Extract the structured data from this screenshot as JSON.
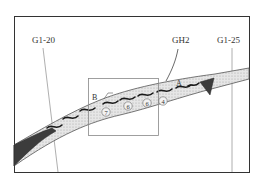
{
  "labels": {
    "well_left": "G1-20",
    "well_mid": "GH2",
    "well_right": "G1-25",
    "point_a": "A",
    "point_b": "B"
  },
  "markers": [
    {
      "id": "7",
      "glyph": "⑦"
    },
    {
      "id": "6a",
      "glyph": "⑥"
    },
    {
      "id": "6b",
      "glyph": "⑥"
    },
    {
      "id": "4",
      "glyph": "④"
    }
  ],
  "colors": {
    "frame": "#333333",
    "band_fill": "#e2e2e2",
    "dark_fill": "#3c3c3c",
    "well_line": "#9a9a9a",
    "wave": "#1a1a1a"
  }
}
